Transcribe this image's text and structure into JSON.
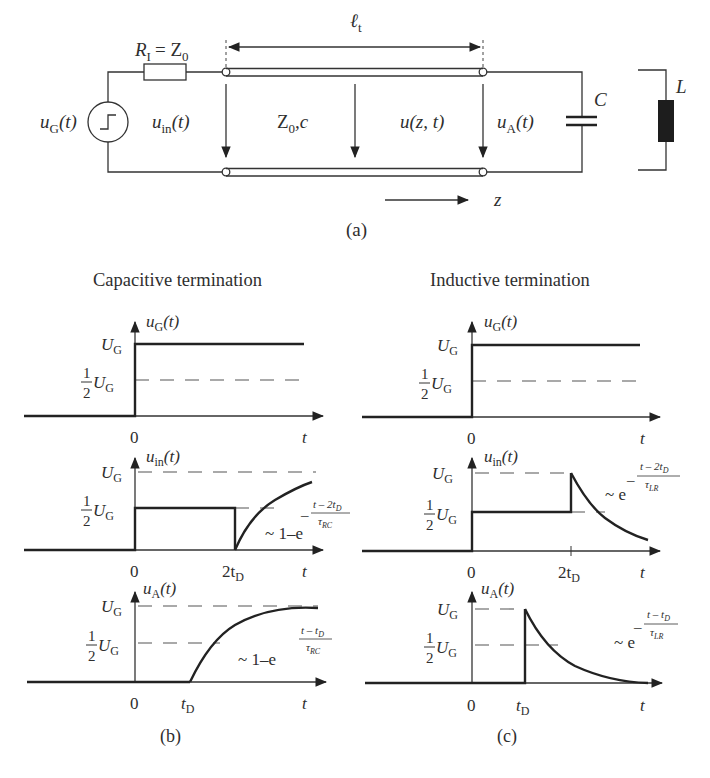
{
  "figure": {
    "circuit": {
      "label": "(a)",
      "resistor_label": "R",
      "resistor_sub": "I",
      "resistor_eq": "= Z",
      "resistor_eq_sub": "0",
      "source_label": "u",
      "source_sub": "G",
      "source_arg": "(t)",
      "input_label": "u",
      "input_sub": "in",
      "input_arg": "(t)",
      "line_label": "Z",
      "line_sub": "0",
      "line_suffix": ",c",
      "wave_label": "u(z, t)",
      "output_label": "u",
      "output_sub": "A",
      "output_arg": "(t)",
      "length_label": "ℓ",
      "length_sub": "t",
      "capacitor_label": "C",
      "inductor_label": "L",
      "z_label": "z"
    },
    "panels": {
      "b": {
        "title": "Capacitive termination",
        "label": "(b)",
        "plots": [
          {
            "ylabel": "u",
            "ysub": "G",
            "yarg": "(t)",
            "ug": "U",
            "ug_sub": "G",
            "half_num": "1",
            "half_den": "2",
            "x0": "0",
            "xt": "t"
          },
          {
            "ylabel": "u",
            "ysub": "in",
            "yarg": "(t)",
            "ug": "U",
            "ug_sub": "G",
            "half_num": "1",
            "half_den": "2",
            "x0": "0",
            "xmark": "2t",
            "xmark_sub": "D",
            "xt": "t",
            "formula_prefix": "~ 1–e",
            "formula_num": "t – 2t",
            "formula_num_sub": "D",
            "formula_den": "τ",
            "formula_den_sub": "RC",
            "formula_minus": "–"
          },
          {
            "ylabel": "u",
            "ysub": "A",
            "yarg": "(t)",
            "ug": "U",
            "ug_sub": "G",
            "half_num": "1",
            "half_den": "2",
            "x0": "0",
            "xmark": "t",
            "xmark_sub": "D",
            "xt": "t",
            "formula_prefix": "~ 1–e",
            "formula_num": "t – t",
            "formula_num_sub": "D",
            "formula_den": "τ",
            "formula_den_sub": "RC",
            "formula_minus": "–"
          }
        ]
      },
      "c": {
        "title": "Inductive termination",
        "label": "(c)",
        "plots": [
          {
            "ylabel": "u",
            "ysub": "G",
            "yarg": "(t)",
            "ug": "U",
            "ug_sub": "G",
            "half_num": "1",
            "half_den": "2",
            "x0": "0",
            "xt": "t"
          },
          {
            "ylabel": "u",
            "ysub": "in",
            "yarg": "(t)",
            "ug": "U",
            "ug_sub": "G",
            "half_num": "1",
            "half_den": "2",
            "x0": "0",
            "xmark": "2t",
            "xmark_sub": "D",
            "xt": "t",
            "formula_prefix": "~ e",
            "formula_num": "t – 2t",
            "formula_num_sub": "D",
            "formula_den": "τ",
            "formula_den_sub": "LR",
            "formula_minus": "–"
          },
          {
            "ylabel": "u",
            "ysub": "A",
            "yarg": "(t)",
            "ug": "U",
            "ug_sub": "G",
            "half_num": "1",
            "half_den": "2",
            "x0": "0",
            "xmark": "t",
            "xmark_sub": "D",
            "xt": "t",
            "formula_prefix": "~ e",
            "formula_num": "t – t",
            "formula_num_sub": "D",
            "formula_den": "τ",
            "formula_den_sub": "LR",
            "formula_minus": "–"
          }
        ]
      }
    }
  }
}
